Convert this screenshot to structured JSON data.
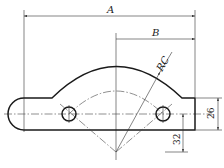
{
  "drawing": {
    "type": "mechanical part drawing",
    "dimensions": {
      "overall_width_label": "A",
      "half_width_label": "B",
      "arc_radius_label": "RC",
      "height_value": "26",
      "offset_value": "32"
    },
    "colors": {
      "line": "#1a1a1a",
      "background": "#ffffff"
    }
  }
}
